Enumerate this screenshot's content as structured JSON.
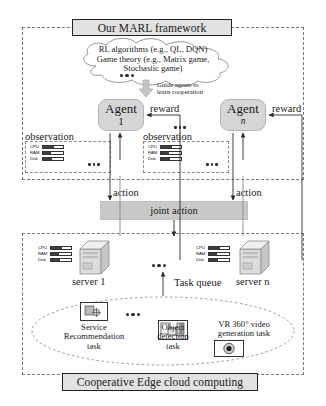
{
  "header": {
    "title": "Our MARL framework"
  },
  "footer": {
    "title": "Cooperative Edge cloud computing"
  },
  "cloud": {
    "line1": "RL algorithms (e.g., QL, DQN)",
    "line2": "Game theory (e.g., Matrix game,",
    "line3": "Stochastic game)"
  },
  "guide": {
    "line1": "Guide agents to",
    "line2": "learn cooperation"
  },
  "agents": [
    {
      "name": "Agent",
      "index": "1",
      "reward_label": "reward",
      "observation_label": "observation",
      "action_label": "action"
    },
    {
      "name": "Agent",
      "index": "n",
      "reward_label": "reward",
      "observation_label": "observation",
      "action_label": "action"
    }
  ],
  "joint_action": {
    "label": "joint action"
  },
  "resources": {
    "rows": [
      {
        "name": "CPU",
        "fill_pct": 55
      },
      {
        "name": "RAM",
        "fill_pct": 40
      },
      {
        "name": "Disk",
        "fill_pct": 45
      }
    ]
  },
  "servers": [
    {
      "label": "server 1"
    },
    {
      "label": "server n"
    }
  ],
  "task_queue": {
    "label": "Task queue"
  },
  "tasks": [
    {
      "icon": "service-recommendation-icon",
      "caption_line1": "Service",
      "caption_line2": "Recommendation",
      "caption_line3": "task"
    },
    {
      "icon": "object-detection-icon",
      "caption_line1": "Object",
      "caption_line2": "detection",
      "caption_line3": "task"
    },
    {
      "icon": "vr-video-icon",
      "caption_line1": "VR 360° video",
      "caption_line2": "generation task",
      "caption_line3": ""
    }
  ],
  "colors": {
    "plate_fill": "#e2e2e2",
    "agent_fill": "#d6d6d6",
    "joint_fill": "#c9c9c9",
    "meter_fill": "#3f3f3f",
    "dash_stroke": "#777777"
  }
}
